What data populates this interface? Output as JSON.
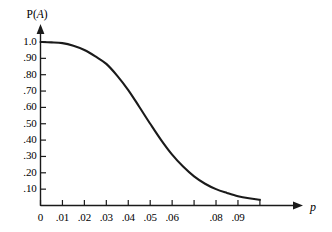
{
  "chart_data": {
    "type": "line",
    "title": "",
    "xlabel": "p",
    "ylabel": "P(A)",
    "xlim": [
      0,
      0.1
    ],
    "ylim": [
      0,
      1.0
    ],
    "grid": false,
    "legend": null,
    "x_tick_labels": [
      "0",
      ".01",
      ".02",
      ".03",
      ".04",
      ".05",
      ".06",
      "",
      ".08",
      ".09",
      ""
    ],
    "x_tick_values": [
      0,
      0.01,
      0.02,
      0.03,
      0.04,
      0.05,
      0.06,
      0.07,
      0.08,
      0.09,
      0.1
    ],
    "y_tick_labels": [
      "1.0",
      ".90",
      ".80",
      ".70",
      ".60",
      ".50",
      ".40",
      ".30",
      ".20",
      ".10"
    ],
    "y_tick_values": [
      1.0,
      0.9,
      0.8,
      0.7,
      0.6,
      0.5,
      0.4,
      0.3,
      0.2,
      0.1
    ],
    "series": [
      {
        "name": "P(A)",
        "color": "#1a1a1a",
        "x": [
          0,
          0.005,
          0.01,
          0.015,
          0.02,
          0.025,
          0.03,
          0.035,
          0.04,
          0.045,
          0.05,
          0.055,
          0.06,
          0.065,
          0.07,
          0.075,
          0.08,
          0.085,
          0.09,
          0.095,
          0.1
        ],
        "values": [
          1.0,
          0.998,
          0.993,
          0.977,
          0.951,
          0.912,
          0.866,
          0.793,
          0.706,
          0.604,
          0.5,
          0.4,
          0.311,
          0.238,
          0.178,
          0.133,
          0.1,
          0.077,
          0.057,
          0.044,
          0.035
        ]
      }
    ]
  },
  "axis_titles": {
    "y": "P(",
    "y_italic": "A",
    "y_close": ")",
    "x": "p"
  }
}
